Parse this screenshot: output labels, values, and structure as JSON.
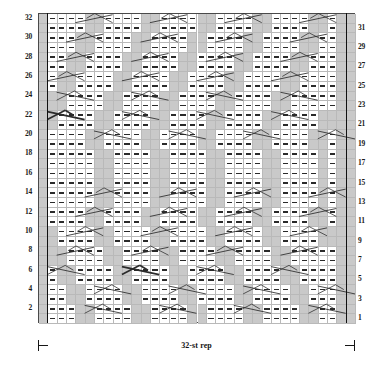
{
  "chart_data": {
    "type": "table",
    "title": "",
    "subtitle": "",
    "xlabel": "",
    "ylabel": "",
    "grid": true,
    "legend_position": "none",
    "chart_kind": "knitting-stitch-chart",
    "columns": 34,
    "rows": 32,
    "repeat_label": "32-st rep",
    "repeat_start_column": 1,
    "repeat_end_column": 33,
    "row_numbers_left": [
      32,
      30,
      28,
      26,
      24,
      22,
      20,
      18,
      16,
      14,
      12,
      10,
      8,
      6,
      4,
      2
    ],
    "row_numbers_right": [
      31,
      29,
      27,
      25,
      23,
      21,
      19,
      17,
      15,
      13,
      11,
      9,
      7,
      5,
      3,
      1
    ],
    "symbol_key": {
      "dash": "purl stitch",
      "gray": "knit / background stitch",
      "diagonal": "travelling stitch or cable cross"
    },
    "colors": {
      "gray_cell": "#c9c9c9",
      "white_cell": "#ffffff",
      "grid_line": "#b9b9b9",
      "border": "#4a4a4a",
      "symbol": "#2a2a2a",
      "repeat_line": "#111111"
    },
    "cells": [
      "GWWWWGGWWWWGGWWWWGGWWWWGGWWWWGGWGG",
      "GWWWWGGWWWWGGWWWWGGWWWWGGWWWWGGWGG",
      "GWWWGGWWWWGGWWWWGGWWWWGGWWWWGGWWGG",
      "GWWWGGWWWWGGWWWWGGWWWWGGWWWWGGWWGG",
      "GWWGGWWWWGGWWWWGGWWWWGGWWWWGGWWWGG",
      "GWWGGWWWWGGWWWWGGWWWWGGWWWWGGWWWGG",
      "GWGGWWWWGGWWWWGGWWWWGGWWWWGGWWWWGG",
      "GWGGWWWWGGWWWWGGWWWWGGWWWWGGWWWWGG",
      "GGGWWWWGGWWWWGGWWWWGGWWWWGGWWWWWGG",
      "GGGWWWWGGWWWWGGWWWWGGWWWWGGWWWWWGG",
      "GGWWWWGGWWWWGGWWWWGGWWWWGGWWWWGGGG",
      "GGWWWWGGWWWWGGWWWWGGWWWWGGWWWWGGGG",
      "GWWWWGGWWWWGGWWWWGGWWWWGGWWWWGGWGG",
      "GWWWWGGWWWWGGWWWWGGWWWWGGWWWWGGWGG",
      "GWWWWWGGWWWWGGWWWWGGWWWWGGWWWWGWGG",
      "GWWWWWGGWWWWGGWWWWGGWWWWGGWWWWGWGG",
      "GWWWWWGGWWWWGGWWWWGGWWWWGGWWWWGWGG",
      "GWWWWWGGWWWWGGWWWWGGWWWWGGWWWWGWGG",
      "GWWWWWGGWWWWGGWWWWGGWWWWGGWWWWGWGG",
      "GWWWWWGGWWWWGGWWWWGGWWWWGGWWWWGWGG",
      "GWWWWGGWWWWGGWWWWGGWWWWGGWWWWGGWGG",
      "GWWWWGGWWWWGGWWWWGGWWWWGGWWWWGGWGG",
      "GGWWWWGGWWWWGGWWWWGGWWWWGGWWWWGGGG",
      "GGWWWWGGWWWWGGWWWWGGWWWWGGWWWWGGGG",
      "GGGWWWWGGWWWWGGWWWWGGWWWWGGWWWWWGG",
      "GGGWWWWGGWWWWGGWWWWGGWWWWGGWWWWWGG",
      "GWGGWWWWGGWWWWGGWWWWGGWWWWGGWWWWGG",
      "GWGGWWWWGGWWWWGGWWWWGGWWWWGGWWWWGG",
      "GWWGGWWWWGGWWWWGGWWWWGGWWWWGGWWWGG",
      "GWWGGWWWWGGWWWWGGWWWWGGWWWWGGWWWGG",
      "GWWWGGWWWWGGWWWWGGWWWWGGWWWWGGWWGG",
      "GWWWGGWWWWGGWWWWGGWWWWGGWWWWGGWWGG"
    ],
    "crossings": [
      {
        "row": 32,
        "col": 4,
        "dir": "right",
        "weight": "thin"
      },
      {
        "row": 32,
        "col": 12,
        "dir": "right",
        "weight": "thin"
      },
      {
        "row": 32,
        "col": 20,
        "dir": "right",
        "weight": "thin"
      },
      {
        "row": 32,
        "col": 28,
        "dir": "right",
        "weight": "thin"
      },
      {
        "row": 30,
        "col": 3,
        "dir": "right",
        "weight": "thin"
      },
      {
        "row": 30,
        "col": 11,
        "dir": "right",
        "weight": "thin"
      },
      {
        "row": 30,
        "col": 19,
        "dir": "right",
        "weight": "thin"
      },
      {
        "row": 30,
        "col": 27,
        "dir": "right",
        "weight": "thin"
      },
      {
        "row": 28,
        "col": 2,
        "dir": "right",
        "weight": "thin"
      },
      {
        "row": 28,
        "col": 10,
        "dir": "right",
        "weight": "thin"
      },
      {
        "row": 28,
        "col": 18,
        "dir": "right",
        "weight": "thin"
      },
      {
        "row": 28,
        "col": 26,
        "dir": "right",
        "weight": "thin"
      },
      {
        "row": 26,
        "col": 1,
        "dir": "right",
        "weight": "thin"
      },
      {
        "row": 26,
        "col": 9,
        "dir": "right",
        "weight": "thin"
      },
      {
        "row": 26,
        "col": 17,
        "dir": "right",
        "weight": "thin"
      },
      {
        "row": 26,
        "col": 25,
        "dir": "right",
        "weight": "thin"
      },
      {
        "row": 24,
        "col": 2,
        "dir": "left",
        "weight": "thin"
      },
      {
        "row": 24,
        "col": 10,
        "dir": "left",
        "weight": "thin"
      },
      {
        "row": 24,
        "col": 18,
        "dir": "left",
        "weight": "thin"
      },
      {
        "row": 24,
        "col": 26,
        "dir": "left",
        "weight": "thin"
      },
      {
        "row": 22,
        "col": 1,
        "dir": "left",
        "weight": "bold"
      },
      {
        "row": 22,
        "col": 9,
        "dir": "left",
        "weight": "thin"
      },
      {
        "row": 22,
        "col": 17,
        "dir": "left",
        "weight": "thin"
      },
      {
        "row": 22,
        "col": 25,
        "dir": "left",
        "weight": "thin"
      },
      {
        "row": 20,
        "col": 6,
        "dir": "left",
        "weight": "thin"
      },
      {
        "row": 20,
        "col": 14,
        "dir": "left",
        "weight": "thin"
      },
      {
        "row": 20,
        "col": 22,
        "dir": "left",
        "weight": "thin"
      },
      {
        "row": 20,
        "col": 30,
        "dir": "left",
        "weight": "thin"
      },
      {
        "row": 14,
        "col": 5,
        "dir": "right",
        "weight": "thin"
      },
      {
        "row": 14,
        "col": 13,
        "dir": "right",
        "weight": "thin"
      },
      {
        "row": 14,
        "col": 21,
        "dir": "right",
        "weight": "thin"
      },
      {
        "row": 14,
        "col": 29,
        "dir": "right",
        "weight": "thin"
      },
      {
        "row": 12,
        "col": 4,
        "dir": "right",
        "weight": "thin"
      },
      {
        "row": 12,
        "col": 12,
        "dir": "right",
        "weight": "thin"
      },
      {
        "row": 12,
        "col": 20,
        "dir": "right",
        "weight": "thin"
      },
      {
        "row": 12,
        "col": 28,
        "dir": "right",
        "weight": "thin"
      },
      {
        "row": 10,
        "col": 3,
        "dir": "right",
        "weight": "thin"
      },
      {
        "row": 10,
        "col": 11,
        "dir": "right",
        "weight": "thin"
      },
      {
        "row": 10,
        "col": 19,
        "dir": "right",
        "weight": "thin"
      },
      {
        "row": 10,
        "col": 27,
        "dir": "right",
        "weight": "thin"
      },
      {
        "row": 8,
        "col": 2,
        "dir": "right",
        "weight": "thin"
      },
      {
        "row": 8,
        "col": 10,
        "dir": "right",
        "weight": "thin"
      },
      {
        "row": 8,
        "col": 18,
        "dir": "right",
        "weight": "thin"
      },
      {
        "row": 8,
        "col": 26,
        "dir": "right",
        "weight": "thin"
      },
      {
        "row": 6,
        "col": 1,
        "dir": "left",
        "weight": "thin"
      },
      {
        "row": 6,
        "col": 9,
        "dir": "left",
        "weight": "bold"
      },
      {
        "row": 6,
        "col": 17,
        "dir": "left",
        "weight": "thin"
      },
      {
        "row": 6,
        "col": 25,
        "dir": "left",
        "weight": "thin"
      },
      {
        "row": 4,
        "col": 6,
        "dir": "left",
        "weight": "thin"
      },
      {
        "row": 4,
        "col": 14,
        "dir": "left",
        "weight": "thin"
      },
      {
        "row": 4,
        "col": 22,
        "dir": "left",
        "weight": "thin"
      },
      {
        "row": 4,
        "col": 30,
        "dir": "left",
        "weight": "thin"
      },
      {
        "row": 2,
        "col": 5,
        "dir": "left",
        "weight": "thin"
      },
      {
        "row": 2,
        "col": 13,
        "dir": "left",
        "weight": "thin"
      },
      {
        "row": 2,
        "col": 21,
        "dir": "left",
        "weight": "thin"
      },
      {
        "row": 2,
        "col": 29,
        "dir": "left",
        "weight": "thin"
      }
    ]
  }
}
